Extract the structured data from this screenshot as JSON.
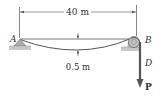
{
  "diagram": {
    "span_label": "40 m",
    "sag_label": "0.5 m",
    "point_a": "A",
    "point_b": "B",
    "point_d": "D",
    "force_label": "P"
  },
  "colors": {
    "line": "#444444",
    "cable": "#555555",
    "support_fill": "#b8b8b8",
    "ground_fill": "#c8c8c8",
    "arrow": "#555555",
    "text": "#333333"
  }
}
